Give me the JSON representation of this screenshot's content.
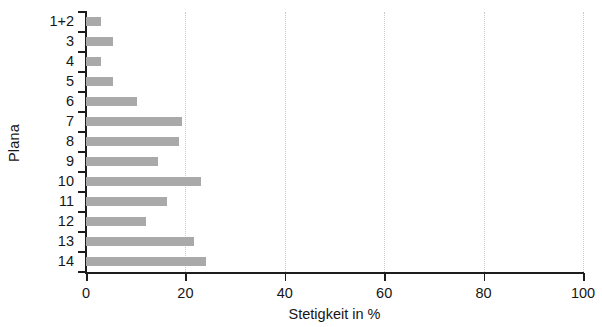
{
  "chart_data": {
    "type": "bar",
    "orientation": "horizontal",
    "title": "",
    "xlabel": "Stetigkeit in %",
    "ylabel": "Plana",
    "categories": [
      "1+2",
      "3",
      "4",
      "5",
      "6",
      "7",
      "8",
      "9",
      "10",
      "11",
      "12",
      "13",
      "14"
    ],
    "values": [
      3,
      5.5,
      3,
      5.5,
      10.3,
      19.3,
      18.7,
      14.5,
      23.1,
      16.3,
      12.1,
      21.7,
      24.1
    ],
    "xlim": [
      0,
      100
    ],
    "xticks": [
      0,
      20,
      40,
      60,
      80,
      100
    ],
    "xticklabels": [
      "0",
      "20",
      "40",
      "60",
      "80",
      "100"
    ],
    "grid": "vertical-dotted",
    "legend": null,
    "bar_color": "#a9a9a9",
    "axis_color": "#1d1d1d",
    "gridline_color": "#c9c9c9"
  }
}
